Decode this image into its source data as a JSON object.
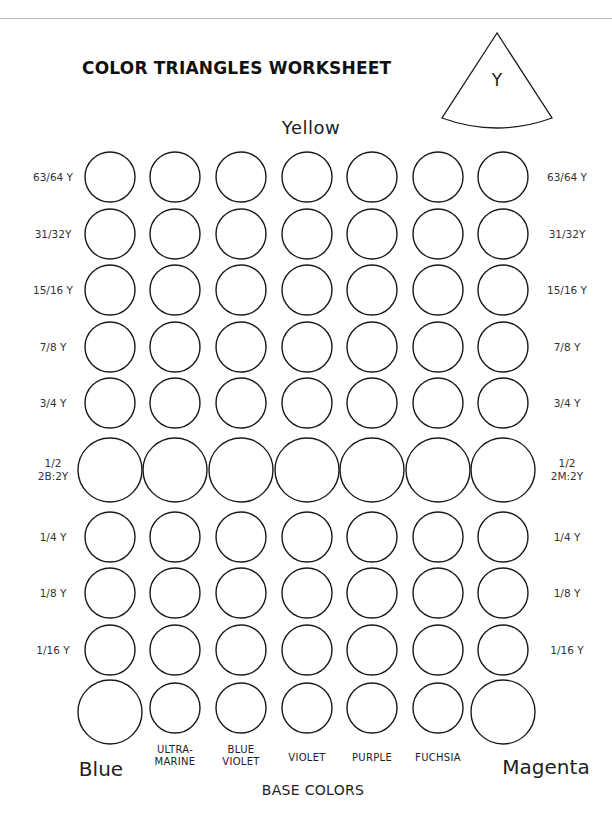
{
  "worksheet": {
    "title": "COLOR TRIANGLES WORKSHEET",
    "wedge_label": "Y",
    "top_color": "Yellow",
    "left_base": "Blue",
    "right_base": "Magenta",
    "base_colors_caption": "BASE COLORS"
  },
  "rows": [
    {
      "left": "63/64 Y",
      "right": "63/64 Y",
      "large": false
    },
    {
      "left": "31/32Y",
      "right": "31/32Y",
      "large": false
    },
    {
      "left": "15/16 Y",
      "right": "15/16 Y",
      "large": false
    },
    {
      "left": "7/8 Y",
      "right": "7/8 Y",
      "large": false
    },
    {
      "left": "3/4 Y",
      "right": "3/4 Y",
      "large": false
    },
    {
      "left": "1/2\n2B:2Y",
      "right": "1/2\n2M:2Y",
      "large": true
    },
    {
      "left": "1/4 Y",
      "right": "1/4 Y",
      "large": false
    },
    {
      "left": "1/8 Y",
      "right": "1/8 Y",
      "large": false
    },
    {
      "left": "1/16 Y",
      "right": "1/16 Y",
      "large": false
    }
  ],
  "base_row": {
    "columns": [
      "",
      "ULTRA-\nMARINE",
      "BLUE\nVIOLET",
      "VIOLET",
      "PURPLE",
      "FUCHSIA",
      ""
    ],
    "large_ends": true
  },
  "colors": {
    "stroke": "#1a1a1a",
    "background": "#ffffff"
  }
}
